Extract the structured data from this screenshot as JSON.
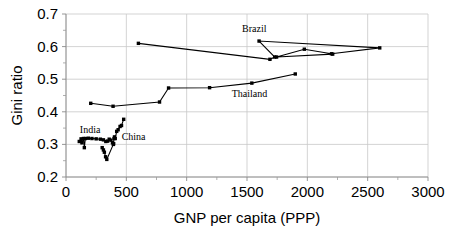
{
  "chart_data": {
    "type": "scatter",
    "title": "",
    "subtitle": "",
    "xlabel": "GNP per capita (PPP)",
    "ylabel": "Gini ratio",
    "xlim": [
      0,
      3000
    ],
    "ylim": [
      0.2,
      0.7
    ],
    "xticks": [
      0,
      500,
      1000,
      1500,
      2000,
      2500,
      3000
    ],
    "xtick_labels": [
      "0",
      "500",
      "1000",
      "1500",
      "2000",
      "2500",
      "3000"
    ],
    "yticks": [
      0.2,
      0.3,
      0.4,
      0.5,
      0.6,
      0.7
    ],
    "ytick_labels": [
      "0.2",
      "0.3",
      "0.4",
      "0.5",
      "0.6",
      "0.7"
    ],
    "grid": true,
    "grid_axis": "both",
    "legend": "inline-annotations",
    "marker": "square",
    "marker_color": "#000000",
    "line_color": "#000000",
    "annotations": [
      {
        "text": "Brazil",
        "x": 1560,
        "y": 0.645
      },
      {
        "text": "Thailand",
        "x": 1520,
        "y": 0.445
      },
      {
        "text": "India",
        "x": 200,
        "y": 0.335
      },
      {
        "text": "China",
        "x": 560,
        "y": 0.312
      }
    ],
    "series": [
      {
        "name": "Brazil",
        "points": [
          {
            "x": 600,
            "y": 0.61
          },
          {
            "x": 1690,
            "y": 0.561
          },
          {
            "x": 1730,
            "y": 0.568
          },
          {
            "x": 1600,
            "y": 0.617
          },
          {
            "x": 2600,
            "y": 0.596
          },
          {
            "x": 2200,
            "y": 0.578
          },
          {
            "x": 1975,
            "y": 0.592
          },
          {
            "x": 1745,
            "y": 0.568
          },
          {
            "x": 2210,
            "y": 0.577
          }
        ]
      },
      {
        "name": "Thailand",
        "points": [
          {
            "x": 205,
            "y": 0.426
          },
          {
            "x": 390,
            "y": 0.417
          },
          {
            "x": 775,
            "y": 0.43
          },
          {
            "x": 850,
            "y": 0.473
          },
          {
            "x": 1190,
            "y": 0.474
          },
          {
            "x": 1540,
            "y": 0.488
          },
          {
            "x": 1900,
            "y": 0.516
          }
        ]
      },
      {
        "name": "India",
        "points": [
          {
            "x": 110,
            "y": 0.309
          },
          {
            "x": 125,
            "y": 0.317
          },
          {
            "x": 132,
            "y": 0.305
          },
          {
            "x": 145,
            "y": 0.318
          },
          {
            "x": 152,
            "y": 0.29
          },
          {
            "x": 160,
            "y": 0.318
          },
          {
            "x": 185,
            "y": 0.319
          },
          {
            "x": 215,
            "y": 0.318
          },
          {
            "x": 250,
            "y": 0.317
          },
          {
            "x": 285,
            "y": 0.316
          },
          {
            "x": 310,
            "y": 0.314
          },
          {
            "x": 330,
            "y": 0.309
          },
          {
            "x": 345,
            "y": 0.31
          },
          {
            "x": 358,
            "y": 0.316
          },
          {
            "x": 372,
            "y": 0.313
          },
          {
            "x": 385,
            "y": 0.305
          },
          {
            "x": 395,
            "y": 0.302
          }
        ]
      },
      {
        "name": "China",
        "points": [
          {
            "x": 300,
            "y": 0.29
          },
          {
            "x": 310,
            "y": 0.283
          },
          {
            "x": 318,
            "y": 0.276
          },
          {
            "x": 328,
            "y": 0.262
          },
          {
            "x": 338,
            "y": 0.254
          },
          {
            "x": 392,
            "y": 0.3
          },
          {
            "x": 398,
            "y": 0.318
          },
          {
            "x": 402,
            "y": 0.323
          },
          {
            "x": 408,
            "y": 0.318
          },
          {
            "x": 420,
            "y": 0.34
          },
          {
            "x": 432,
            "y": 0.345
          },
          {
            "x": 448,
            "y": 0.355
          },
          {
            "x": 460,
            "y": 0.358
          },
          {
            "x": 478,
            "y": 0.377
          }
        ]
      }
    ]
  }
}
